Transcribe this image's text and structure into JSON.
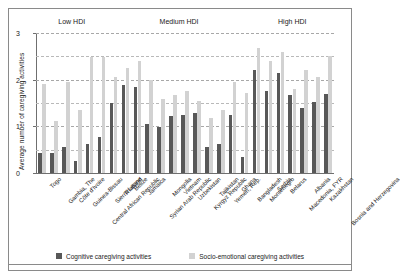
{
  "chart_data": {
    "type": "bar",
    "title": "",
    "xlabel": "",
    "ylabel": "Average number of caregiving activities",
    "ylim": [
      0,
      3
    ],
    "yticks": [
      0,
      1,
      2,
      3
    ],
    "ytick_labels": [
      "0",
      "1",
      "2",
      "3"
    ],
    "gridlines": [
      0.5,
      1.0,
      1.5,
      2.0,
      2.5,
      3.0
    ],
    "grid": true,
    "legend_position": "bottom",
    "categories": [
      "Togo",
      "Gambia, The",
      "Côte d'Ivoire",
      "Guinea-Bissau",
      "Central African Republic",
      "Sierra Leone",
      "Thailand",
      "Belize",
      "Jamaica",
      "Syrian Arab Republic",
      "Mongolia",
      "Vietnam",
      "Uzbekistan",
      "Kyrgyz Republic",
      "Tajikistan",
      "Yemen, Rep.",
      "Ghana",
      "Bangladesh",
      "Montenegro",
      "Serbia",
      "Belarus",
      "Macedonia, FYR",
      "Albania",
      "Kazakhstan",
      "Bosnia and Herzegovina"
    ],
    "series": [
      {
        "name": "Cognitive caregiving activities",
        "color": "#585858",
        "values": [
          0.42,
          0.42,
          0.55,
          0.25,
          0.62,
          0.78,
          1.5,
          1.88,
          1.85,
          1.05,
          0.98,
          1.22,
          1.25,
          1.28,
          0.55,
          0.62,
          1.25,
          0.35,
          2.2,
          1.75,
          2.15,
          1.68,
          1.4,
          1.52,
          1.7
        ]
      },
      {
        "name": "Socio-emotional caregiving activities",
        "color": "#d2d2d2",
        "values": [
          1.9,
          1.12,
          1.95,
          1.35,
          2.48,
          2.48,
          2.05,
          2.25,
          2.4,
          2.0,
          1.58,
          1.68,
          1.75,
          1.55,
          1.18,
          1.35,
          1.95,
          1.72,
          2.68,
          2.4,
          2.6,
          1.8,
          2.2,
          2.05,
          2.5
        ]
      }
    ],
    "groups": [
      {
        "label": "Low HDI",
        "start": 0,
        "end": 5
      },
      {
        "label": "Medium HDI",
        "start": 6,
        "end": 17
      },
      {
        "label": "High HDI",
        "start": 18,
        "end": 24
      }
    ]
  },
  "legend": {
    "items": [
      {
        "label": "Cognitive caregiving activities",
        "swatch": "cog"
      },
      {
        "label": "Socio-emotional caregiving activities",
        "swatch": "soc"
      }
    ]
  }
}
